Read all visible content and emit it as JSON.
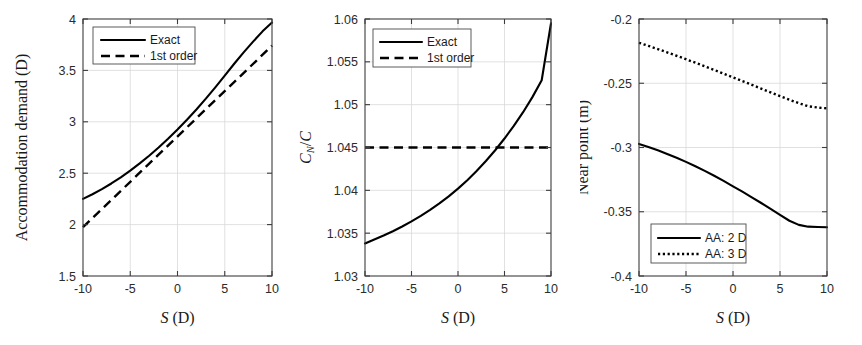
{
  "figure": {
    "width": 862,
    "height": 345,
    "background": "#ffffff",
    "axis_color": "#3c3c3c",
    "grid_color": "#d9d9d9",
    "curve_color": "#000000"
  },
  "chart_data": [
    {
      "id": "panel-accommodation-demand",
      "type": "line",
      "title": "",
      "xlabel": "S (D)",
      "xlabel_italic": "S",
      "xlabel_rest": " (D)",
      "ylabel": "Accommodation demand (D)",
      "xlim": [
        -10,
        10
      ],
      "ylim": [
        1.5,
        4
      ],
      "xticks": [
        -10,
        -5,
        0,
        5,
        10
      ],
      "xticklabels": [
        "-10",
        "-5",
        "0",
        "5",
        "10"
      ],
      "yticks": [
        1.5,
        2,
        2.5,
        3,
        3.5,
        4
      ],
      "yticklabels": [
        "1.5",
        "2",
        "2.5",
        "3",
        "3.5",
        "4"
      ],
      "grid": true,
      "legend_position": "north-west",
      "series": [
        {
          "name": "Exact",
          "style": "solid",
          "x": [
            -10,
            -9,
            -8,
            -7,
            -6,
            -5,
            -4,
            -3,
            -2,
            -1,
            0,
            1,
            2,
            3,
            4,
            5,
            6,
            7,
            8,
            9,
            10
          ],
          "values": [
            2.25,
            2.295,
            2.345,
            2.4,
            2.46,
            2.525,
            2.595,
            2.67,
            2.75,
            2.835,
            2.925,
            3.02,
            3.12,
            3.225,
            3.335,
            3.45,
            3.565,
            3.675,
            3.78,
            3.88,
            3.965
          ]
        },
        {
          "name": "1st order",
          "style": "dashed",
          "x": [
            -10,
            10
          ],
          "values": [
            1.975,
            3.74
          ]
        }
      ]
    },
    {
      "id": "panel-cn-over-c",
      "type": "line",
      "title": "",
      "xlabel": "S (D)",
      "xlabel_italic": "S",
      "xlabel_rest": " (D)",
      "ylabel": "C_N/C",
      "ylabel_parts": {
        "c1": "C",
        "sub": "N",
        "slash": "/",
        "c2": "C"
      },
      "xlim": [
        -10,
        10
      ],
      "ylim": [
        1.03,
        1.06
      ],
      "xticks": [
        -10,
        -5,
        0,
        5,
        10
      ],
      "xticklabels": [
        "-10",
        "-5",
        "0",
        "5",
        "10"
      ],
      "yticks": [
        1.03,
        1.035,
        1.04,
        1.045,
        1.05,
        1.055,
        1.06
      ],
      "yticklabels": [
        "1.03",
        "1.035",
        "1.04",
        "1.045",
        "1.05",
        "1.055",
        "1.06"
      ],
      "grid": true,
      "legend_position": "north-west",
      "series": [
        {
          "name": "Exact",
          "style": "solid",
          "x": [
            -10,
            -9,
            -8,
            -7,
            -6,
            -5,
            -4,
            -3,
            -2,
            -1,
            0,
            1,
            2,
            3,
            4,
            5,
            6,
            7,
            8,
            9,
            10
          ],
          "values": [
            1.0338,
            1.03425,
            1.03472,
            1.03523,
            1.03578,
            1.03638,
            1.03702,
            1.03772,
            1.03848,
            1.0393,
            1.0402,
            1.04118,
            1.04225,
            1.04342,
            1.04468,
            1.04605,
            1.04752,
            1.04912,
            1.05088,
            1.05285,
            1.0595
          ]
        },
        {
          "name": "1st order",
          "style": "dashed",
          "x": [
            -10,
            10
          ],
          "values": [
            1.045,
            1.045
          ]
        }
      ]
    },
    {
      "id": "panel-near-point",
      "type": "line",
      "title": "",
      "xlabel": "S (D)",
      "xlabel_italic": "S",
      "xlabel_rest": " (D)",
      "ylabel": "Near point (m)",
      "xlim": [
        -10,
        10
      ],
      "ylim": [
        -0.4,
        -0.2
      ],
      "xticks": [
        -10,
        -5,
        0,
        5,
        10
      ],
      "xticklabels": [
        "-10",
        "-5",
        "0",
        "5",
        "10"
      ],
      "yticks": [
        -0.4,
        -0.35,
        -0.3,
        -0.25,
        -0.2
      ],
      "yticklabels": [
        "-0.4",
        "-0.35",
        "-0.3",
        "-0.25",
        "-0.2"
      ],
      "grid": true,
      "legend_position": "south-west",
      "series": [
        {
          "name": "AA: 2 D",
          "style": "solid",
          "x": [
            -10,
            -9,
            -8,
            -7,
            -6,
            -5,
            -4,
            -3,
            -2,
            -1,
            0,
            1,
            2,
            3,
            4,
            5,
            6,
            7,
            8,
            9,
            10
          ],
          "values": [
            -0.2972,
            -0.2996,
            -0.3022,
            -0.305,
            -0.308,
            -0.3112,
            -0.3146,
            -0.3182,
            -0.322,
            -0.326,
            -0.3302,
            -0.3344,
            -0.3388,
            -0.3432,
            -0.3478,
            -0.3524,
            -0.357,
            -0.3602,
            -0.3616,
            -0.3619,
            -0.3621
          ]
        },
        {
          "name": "AA: 3 D",
          "style": "dotted",
          "x": [
            -10,
            -9,
            -8,
            -7,
            -6,
            -5,
            -4,
            -3,
            -2,
            -1,
            0,
            1,
            2,
            3,
            4,
            5,
            6,
            7,
            8,
            9,
            10
          ],
          "values": [
            -0.2185,
            -0.2209,
            -0.2234,
            -0.226,
            -0.2286,
            -0.2313,
            -0.234,
            -0.2368,
            -0.2396,
            -0.2425,
            -0.2454,
            -0.2483,
            -0.2512,
            -0.2542,
            -0.2571,
            -0.26,
            -0.2628,
            -0.2655,
            -0.2679,
            -0.2689,
            -0.2695
          ]
        }
      ]
    }
  ]
}
